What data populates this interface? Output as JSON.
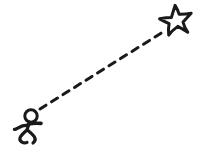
{
  "scene": {
    "title": "Stick figure running toward a star",
    "background_color": "#ffffff",
    "ink_color": "#1a1a1a",
    "width": 200,
    "height": 152,
    "style": "hand-drawn line art",
    "elements": [
      {
        "name": "stick-figure",
        "label": "Running stick figure",
        "pose": "running",
        "position": {
          "x": 14,
          "y": 108,
          "width": 30,
          "height": 38
        }
      },
      {
        "name": "dashed-path",
        "label": "Dashed trajectory path",
        "start": {
          "x": 40,
          "y": 109
        },
        "end": {
          "x": 163,
          "y": 31
        },
        "dash_count": 12,
        "stroke_width": 3
      },
      {
        "name": "star",
        "label": "Five pointed star goal",
        "points": 5,
        "filled": false,
        "position": {
          "x": 160,
          "y": 5,
          "width": 33,
          "height": 31
        }
      }
    ]
  },
  "figure": {
    "head": {
      "cx": 31,
      "cy": 116,
      "r": 6.2,
      "stroke_width": 3
    },
    "body_label": "torso",
    "arm_label": "extended arm",
    "leg_label": "striding legs"
  },
  "star_detail": {
    "outline_stroke_width": 3,
    "rotation_deg": -8,
    "outer_radius": 16,
    "inner_radius": 6.6,
    "center": {
      "cx": 176,
      "cy": 21
    }
  },
  "dashes": [
    {
      "x1": 40.0,
      "y1": 109.0,
      "x2": 46.0,
      "y2": 105.2
    },
    {
      "x1": 51.5,
      "y1": 101.8,
      "x2": 57.5,
      "y2": 98.0
    },
    {
      "x1": 63.0,
      "y1": 94.6,
      "x2": 69.0,
      "y2": 90.8
    },
    {
      "x1": 74.5,
      "y1": 87.4,
      "x2": 80.5,
      "y2": 83.6
    },
    {
      "x1": 86.0,
      "y1": 80.2,
      "x2": 92.0,
      "y2": 76.4
    },
    {
      "x1": 97.5,
      "y1": 73.0,
      "x2": 103.5,
      "y2": 69.2
    },
    {
      "x1": 109.0,
      "y1": 65.8,
      "x2": 115.0,
      "y2": 62.0
    },
    {
      "x1": 120.5,
      "y1": 58.6,
      "x2": 126.5,
      "y2": 54.8
    },
    {
      "x1": 132.0,
      "y1": 51.4,
      "x2": 138.0,
      "y2": 47.6
    },
    {
      "x1": 143.5,
      "y1": 44.2,
      "x2": 149.5,
      "y2": 40.4
    },
    {
      "x1": 155.0,
      "y1": 37.0,
      "x2": 161.0,
      "y2": 33.2
    }
  ]
}
